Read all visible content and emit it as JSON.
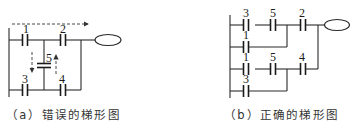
{
  "figure_a": {
    "caption": "（a）错误的梯形图",
    "contacts": [
      {
        "id": "1",
        "label": "1",
        "rung": "top",
        "position": "left"
      },
      {
        "id": "2",
        "label": "2",
        "rung": "top",
        "position": "right"
      },
      {
        "id": "5",
        "label": "5",
        "rung": "vertical-bridge",
        "position": "middle"
      },
      {
        "id": "3",
        "label": "3",
        "rung": "bottom",
        "position": "left"
      },
      {
        "id": "4",
        "label": "4",
        "rung": "bottom",
        "position": "right"
      }
    ],
    "output": "coil",
    "annotations": [
      "dashed-flow-arrow-right",
      "dashed-flow-arrow-down",
      "dashed-flow-arrow-up"
    ]
  },
  "figure_b": {
    "caption": "（b）正确的梯形图",
    "rungs": [
      {
        "contacts": [
          "3",
          "5",
          "2"
        ]
      },
      {
        "contacts": [
          "1"
        ]
      },
      {
        "contacts": [
          "1",
          "5",
          "4"
        ]
      },
      {
        "contacts": [
          "3"
        ]
      }
    ],
    "labels": {
      "r1c1": "3",
      "r1c2": "5",
      "r1c3": "2",
      "r2c1": "1",
      "r3c1": "1",
      "r3c2": "5",
      "r3c3": "4",
      "r4c1": "3"
    },
    "output": "coil"
  }
}
